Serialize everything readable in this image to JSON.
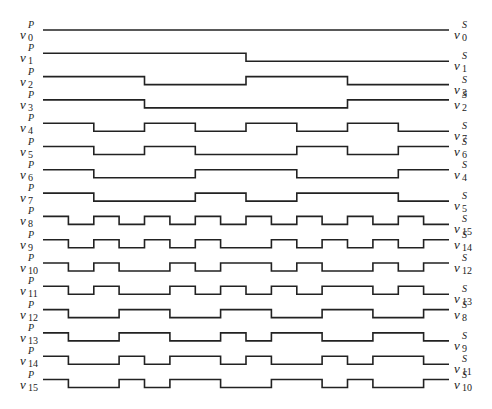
{
  "diagram": {
    "type": "timing-diagram",
    "x_start": 43,
    "x_end": 449,
    "segments": 16,
    "row_top": 30,
    "row_pitch": 23.3,
    "pulse_height": 8,
    "stroke_color": "#222222",
    "rows": [
      {
        "left": {
          "var": "v",
          "sup": "P",
          "sub": "0"
        },
        "right": {
          "var": "v",
          "sup": "S",
          "sub": "0"
        },
        "bits": "1111111111111111"
      },
      {
        "left": {
          "var": "v",
          "sup": "P",
          "sub": "1"
        },
        "right": {
          "var": "v",
          "sup": "S",
          "sub": "1"
        },
        "bits": "1111111100000000"
      },
      {
        "left": {
          "var": "v",
          "sup": "P",
          "sub": "2"
        },
        "right": {
          "var": "v",
          "sup": "S",
          "sub": "3"
        },
        "bits": "1111000011110000"
      },
      {
        "left": {
          "var": "v",
          "sup": "P",
          "sub": "3"
        },
        "right": {
          "var": "v",
          "sup": "S",
          "sub": "2"
        },
        "bits": "1111000000001111"
      },
      {
        "left": {
          "var": "v",
          "sup": "P",
          "sub": "4"
        },
        "right": {
          "var": "v",
          "sup": "S",
          "sub": "7"
        },
        "bits": "1100110011001100"
      },
      {
        "left": {
          "var": "v",
          "sup": "P",
          "sub": "5"
        },
        "right": {
          "var": "v",
          "sup": "S",
          "sub": "6"
        },
        "bits": "1100110000110011"
      },
      {
        "left": {
          "var": "v",
          "sup": "P",
          "sub": "6"
        },
        "right": {
          "var": "v",
          "sup": "S",
          "sub": "4"
        },
        "bits": "1100001111000011"
      },
      {
        "left": {
          "var": "v",
          "sup": "P",
          "sub": "7"
        },
        "right": {
          "var": "v",
          "sup": "S",
          "sub": "5"
        },
        "bits": "1100001100111100"
      },
      {
        "left": {
          "var": "v",
          "sup": "P",
          "sub": "8"
        },
        "right": {
          "var": "v",
          "sup": "S",
          "sub": "15"
        },
        "bits": "1010101010101010"
      },
      {
        "left": {
          "var": "v",
          "sup": "P",
          "sub": "9"
        },
        "right": {
          "var": "v",
          "sup": "S",
          "sub": "14"
        },
        "bits": "1010101001010101"
      },
      {
        "left": {
          "var": "v",
          "sup": "P",
          "sub": "10"
        },
        "right": {
          "var": "v",
          "sup": "S",
          "sub": "12"
        },
        "bits": "1010010110100101"
      },
      {
        "left": {
          "var": "v",
          "sup": "P",
          "sub": "11"
        },
        "right": {
          "var": "v",
          "sup": "S",
          "sub": "13"
        },
        "bits": "1010010101011010"
      },
      {
        "left": {
          "var": "v",
          "sup": "P",
          "sub": "12"
        },
        "right": {
          "var": "v",
          "sup": "S",
          "sub": "8"
        },
        "bits": "1001100110011001"
      },
      {
        "left": {
          "var": "v",
          "sup": "P",
          "sub": "13"
        },
        "right": {
          "var": "v",
          "sup": "S",
          "sub": "9"
        },
        "bits": "1001100101100110"
      },
      {
        "left": {
          "var": "v",
          "sup": "P",
          "sub": "14"
        },
        "right": {
          "var": "v",
          "sup": "S",
          "sub": "11"
        },
        "bits": "1001011010010110"
      },
      {
        "left": {
          "var": "v",
          "sup": "P",
          "sub": "15"
        },
        "right": {
          "var": "v",
          "sup": "S",
          "sub": "10"
        },
        "bits": "1001011001101001"
      }
    ]
  }
}
